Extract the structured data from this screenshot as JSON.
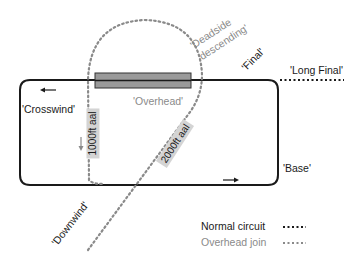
{
  "diagram": {
    "colors": {
      "normal_circuit": "#1a1a1a",
      "overhead_join": "#8a8a8a",
      "runway_fill": "#9a9a9a",
      "tag_bg": "#d4d4d4"
    },
    "labels": {
      "crosswind": "'Crosswind'",
      "downwind": "'Downwind'",
      "base": "'Base'",
      "final": "'Final'",
      "long_final": "'Long Final'",
      "overhead": "'Overhead'",
      "deadside_descending": "'Deadside descending'",
      "deadside_line1": "'Deadside",
      "deadside_line2": "descending'"
    },
    "altitude_tags": {
      "low": "1000ft aal",
      "high": "2000ft aal"
    },
    "legend": [
      {
        "label": "Normal circuit",
        "style": "dark-dotted"
      },
      {
        "label": "Overhead join",
        "style": "grey-dotted"
      }
    ],
    "legend_swatch": "•••••"
  }
}
